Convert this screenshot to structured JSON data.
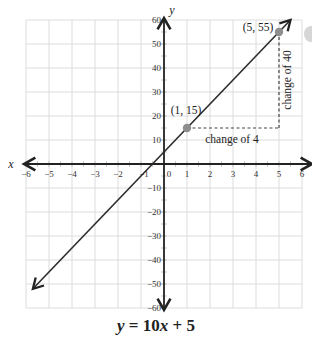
{
  "chart_data": {
    "type": "line",
    "title": "y = 10x + 5",
    "xlabel": "x",
    "ylabel": "y",
    "xlim": [
      -6,
      6
    ],
    "ylim": [
      -60,
      60
    ],
    "grid": true,
    "x_ticks": [
      -6,
      -5,
      -4,
      -3,
      -2,
      -1,
      0,
      1,
      2,
      3,
      4,
      5,
      6
    ],
    "y_ticks": [
      -60,
      -50,
      -40,
      -30,
      -20,
      -10,
      10,
      20,
      30,
      40,
      50,
      60
    ],
    "series": [
      {
        "name": "y = 10x + 5",
        "slope": 10,
        "intercept": 5,
        "x": [
          -5.7,
          5.5
        ],
        "y": [
          -52,
          60
        ]
      }
    ],
    "points": [
      {
        "label": "(1, 15)",
        "x": 1,
        "y": 15
      },
      {
        "label": "(5, 55)",
        "x": 5,
        "y": 55
      }
    ],
    "annotations": [
      {
        "text": "change of 4",
        "type": "horizontal-run",
        "from": [
          1,
          15
        ],
        "to": [
          5,
          15
        ]
      },
      {
        "text": "change of 40",
        "type": "vertical-rise",
        "from": [
          5,
          15
        ],
        "to": [
          5,
          55
        ]
      }
    ],
    "colors": {
      "line": "#2b2b2b",
      "grid": "#dcdcdc",
      "point": "#8e8e8e",
      "dash": "#444444"
    }
  },
  "labels": {
    "x_axis": "x",
    "y_axis": "y",
    "equation_y": "y",
    "equation_rest": " = 10",
    "equation_x": "x",
    "equation_tail": " + 5",
    "point1": "(1, 15)",
    "point2": "(5, 55)",
    "run": "change of 4",
    "rise": "change of 40",
    "origin": "0"
  }
}
